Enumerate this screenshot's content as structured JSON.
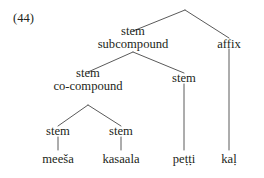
{
  "figure": {
    "example_number": "(44)",
    "ink_color": "#231f20",
    "background_color": "#ffffff",
    "line_color": "#5a5a5a"
  },
  "tree": {
    "type": "constituency-tree",
    "nodes": {
      "root": {
        "line1": "stem",
        "line2": "subcompound"
      },
      "affix": {
        "line1": "affix"
      },
      "cocompound": {
        "line1": "stem",
        "line2": "co-compound"
      },
      "stem_petti": {
        "line1": "stem"
      },
      "stem_meesa": {
        "line1": "stem"
      },
      "stem_kasaala": {
        "line1": "stem"
      }
    },
    "leaves": {
      "meesa": "meeša",
      "kasaala": "kasaala",
      "petti": "peṭṭi",
      "kal": "kaḷ"
    }
  }
}
